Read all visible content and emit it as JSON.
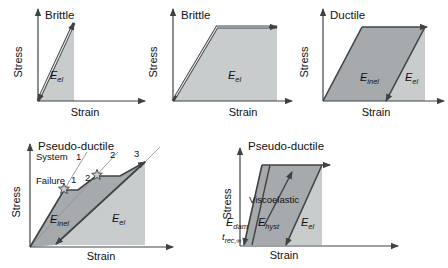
{
  "figure": {
    "colors": {
      "light_region": "#c8cccd",
      "dark_region": "#a6aaac",
      "line": "#3f4346",
      "thin_line": "#909496",
      "background": "#ffffff"
    },
    "panels": {
      "p1": {
        "title": "Brittle",
        "xlabel": "Strain",
        "ylabel": "Stress",
        "e_el": {
          "main": "E",
          "sub": "el"
        }
      },
      "p2": {
        "title": "Brittle",
        "xlabel": "Strain",
        "ylabel": "Stress",
        "e_el": {
          "main": "E",
          "sub": "el"
        }
      },
      "p3": {
        "title": "Ductile",
        "xlabel": "Strain",
        "ylabel": "Stress",
        "e_inel": {
          "main": "E",
          "sub": "inel"
        },
        "e_el": {
          "main": "E",
          "sub": "el"
        }
      },
      "p4": {
        "title": "Pseudo-ductile",
        "xlabel": "Strain",
        "ylabel": "Stress",
        "system": {
          "label": "System",
          "n1": "1",
          "n2": "2",
          "n3": "3"
        },
        "failure": {
          "label": "Failure",
          "n1": "1",
          "n2": "2"
        },
        "e_inel": {
          "main": "E",
          "sub": "inel"
        },
        "e_el": {
          "main": "E",
          "sub": "el"
        }
      },
      "p5": {
        "title": "Pseudo-ductile",
        "xlabel": "Strain",
        "ylabel": "Stress",
        "viscoelastic_label": "Viscoelastic",
        "t_rec": {
          "main": "t",
          "sub": "rec,∞"
        },
        "e_dam": {
          "main": "E",
          "sub": "dam"
        },
        "e_hyst": {
          "main": "E",
          "sub": "hyst"
        },
        "e_el": {
          "main": "E",
          "sub": "el"
        }
      }
    }
  }
}
